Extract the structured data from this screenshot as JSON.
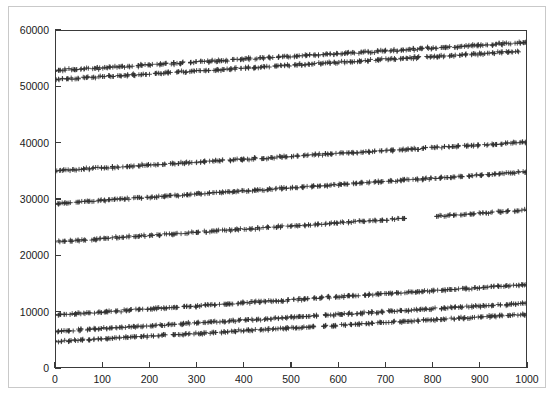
{
  "chart_data": {
    "type": "scatter",
    "title": "",
    "subtitle": "",
    "xlabel": "",
    "ylabel": "",
    "xlim": [
      0,
      1000
    ],
    "ylim": [
      0,
      60000
    ],
    "grid": false,
    "legend": null,
    "legend_position": "none",
    "marker": "plus",
    "marker_color": "#303030",
    "background_color": "#ffffff",
    "frame_color": "#3a3a3a",
    "xticks": [
      0,
      100,
      200,
      300,
      400,
      500,
      600,
      700,
      800,
      900,
      1000
    ],
    "xtick_labels": [
      "0",
      "100",
      "200",
      "300",
      "400",
      "500",
      "600",
      "700",
      "800",
      "900",
      "1000"
    ],
    "yticks": [
      0,
      10000,
      20000,
      30000,
      40000,
      50000,
      60000
    ],
    "ytick_labels": [
      "0",
      "10000",
      "20000",
      "30000",
      "40000",
      "50000",
      "60000"
    ],
    "series": [
      {
        "name": "band-1",
        "description": "topmost band",
        "y_start": 52800,
        "y_end": 57800,
        "x_start": 0,
        "x_end": 1000,
        "jitter": 190,
        "n_points": 300,
        "seed": 11
      },
      {
        "name": "band-2",
        "description": "second band from top",
        "y_start": 51200,
        "y_end": 56200,
        "x_start": 0,
        "x_end": 985,
        "jitter": 180,
        "n_points": 290,
        "seed": 23
      },
      {
        "name": "band-3",
        "description": "band near 35000 rising to 40000",
        "y_start": 35000,
        "y_end": 40100,
        "x_start": 0,
        "x_end": 1000,
        "jitter": 170,
        "n_points": 285,
        "seed": 37
      },
      {
        "name": "band-4",
        "description": "band near 29200 rising to 34800",
        "y_start": 29200,
        "y_end": 34800,
        "x_start": 0,
        "x_end": 1000,
        "jitter": 165,
        "n_points": 300,
        "seed": 53
      },
      {
        "name": "band-5",
        "description": "band near 22400 rising to 28000, sparse gap near x=760-810",
        "y_start": 22400,
        "y_end": 28000,
        "x_start": 0,
        "x_end": 1000,
        "jitter": 160,
        "n_points": 265,
        "seed": 71,
        "gaps": [
          [
            748,
            806
          ]
        ]
      },
      {
        "name": "band-6",
        "description": "lower cluster upper band 9400 to 14800",
        "y_start": 9400,
        "y_end": 14800,
        "x_start": 0,
        "x_end": 1000,
        "jitter": 175,
        "n_points": 300,
        "seed": 89
      },
      {
        "name": "band-7",
        "description": "lower cluster middle band 6500 to 11500",
        "y_start": 6500,
        "y_end": 11500,
        "x_start": 0,
        "x_end": 1000,
        "jitter": 170,
        "n_points": 295,
        "seed": 101
      },
      {
        "name": "band-8",
        "description": "lower cluster bottom band 4700 to 9500",
        "y_start": 4700,
        "y_end": 9500,
        "x_start": 0,
        "x_end": 1000,
        "jitter": 165,
        "n_points": 290,
        "seed": 127
      }
    ]
  }
}
